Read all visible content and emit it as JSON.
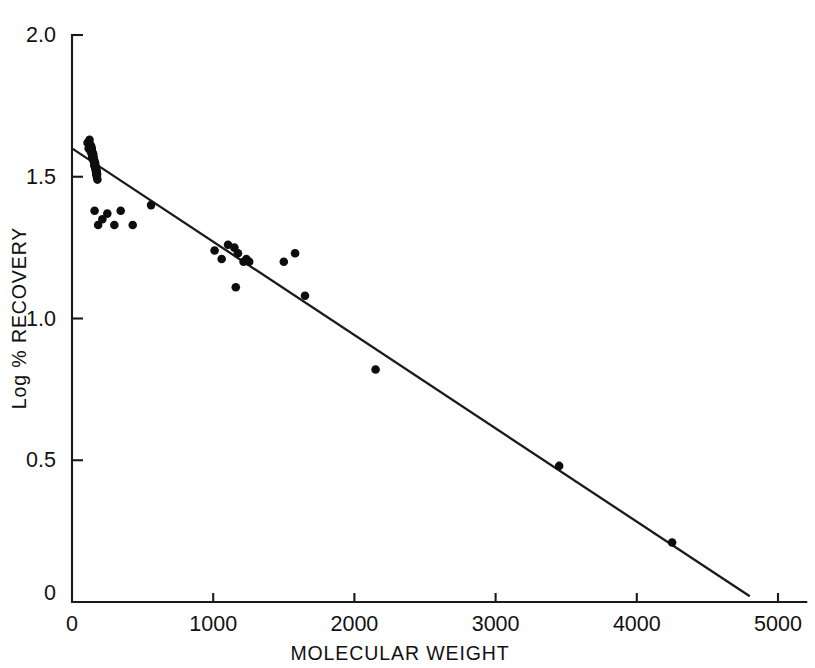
{
  "chart_data": {
    "type": "scatter",
    "title": "",
    "xlabel": "MOLECULAR WEIGHT",
    "ylabel": "Log % RECOVERY",
    "xlim": [
      0,
      5200
    ],
    "ylim": [
      0,
      2.0
    ],
    "xticks": [
      0,
      1000,
      2000,
      3000,
      4000,
      5000
    ],
    "xtick_labels": [
      "0",
      "1000",
      "2000",
      "3000",
      "4000",
      "5000"
    ],
    "yticks": [
      0,
      0.5,
      1.0,
      1.5,
      2.0
    ],
    "ytick_labels": [
      "0",
      "0.5",
      "1.0",
      "1.5",
      "2.0"
    ],
    "grid": false,
    "legend": false,
    "marker": "filled-circle",
    "marker_color": "#0d0d0d",
    "line_color": "#1a1a1a",
    "series": [
      {
        "name": "Recovery data",
        "x": [
          110,
          118,
          132,
          140,
          128,
          146,
          150,
          136,
          124,
          155,
          142,
          160,
          138,
          152,
          148,
          165,
          158,
          144,
          170,
          162,
          134,
          154,
          168,
          146,
          175,
          156,
          149,
          163,
          172,
          141,
          159,
          167,
          178,
          151,
          145,
          164,
          173,
          157,
          147,
          169,
          153,
          161,
          176,
          143,
          166,
          180,
          171,
          139,
          160,
          185,
          215,
          250,
          300,
          345,
          430,
          560,
          1010,
          1060,
          1105,
          1150,
          1160,
          1175,
          1215,
          1235,
          1255,
          1500,
          1580,
          1650,
          2150,
          3450,
          4250
        ],
        "y": [
          1.62,
          1.6,
          1.59,
          1.58,
          1.61,
          1.57,
          1.58,
          1.6,
          1.63,
          1.56,
          1.59,
          1.55,
          1.6,
          1.57,
          1.58,
          1.54,
          1.55,
          1.58,
          1.53,
          1.54,
          1.61,
          1.56,
          1.53,
          1.57,
          1.52,
          1.56,
          1.57,
          1.55,
          1.52,
          1.59,
          1.54,
          1.53,
          1.51,
          1.56,
          1.57,
          1.54,
          1.51,
          1.55,
          1.57,
          1.52,
          1.56,
          1.54,
          1.5,
          1.58,
          1.53,
          1.49,
          1.51,
          1.6,
          1.38,
          1.33,
          1.35,
          1.37,
          1.33,
          1.38,
          1.33,
          1.4,
          1.24,
          1.21,
          1.26,
          1.25,
          1.11,
          1.23,
          1.2,
          1.21,
          1.2,
          1.2,
          1.23,
          1.08,
          0.82,
          0.48,
          0.21
        ]
      }
    ],
    "fit_line": {
      "name": "Linear regression",
      "x_start": 0,
      "y_start": 1.6,
      "x_end": 4800,
      "y_end": 0.02
    }
  }
}
